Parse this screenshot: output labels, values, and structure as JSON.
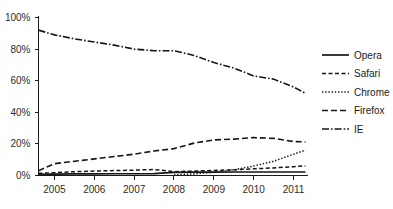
{
  "chart_data": {
    "type": "line",
    "title": "",
    "subtitle": "",
    "xlabel": "",
    "ylabel": "",
    "x": [
      2005,
      2006,
      2007,
      2008,
      2009,
      2010,
      2011
    ],
    "xlim": [
      2004.6,
      2011.3
    ],
    "ylim": [
      0,
      100
    ],
    "xticks": [
      "2005",
      "2006",
      "2007",
      "2008",
      "2009",
      "2010",
      "2011"
    ],
    "yticks": [
      "0%",
      "20%",
      "40%",
      "60%",
      "80%",
      "100%"
    ],
    "ytick_values": [
      0,
      20,
      40,
      60,
      80,
      100
    ],
    "grid": false,
    "legend_position": "right",
    "series": [
      {
        "name": "Opera",
        "style": "solid",
        "dash": "0",
        "width": 1.7,
        "x": [
          2004.6,
          2005,
          2005.5,
          2006,
          2006.5,
          2007,
          2007.5,
          2008,
          2008.5,
          2009,
          2009.5,
          2010,
          2010.5,
          2011,
          2011.3
        ],
        "values": [
          0.8,
          0.9,
          1.0,
          1.0,
          1.1,
          1.1,
          1.2,
          2.0,
          2.1,
          2.1,
          2.2,
          2.2,
          2.2,
          2.2,
          2.2
        ]
      },
      {
        "name": "Safari",
        "style": "dashed",
        "dash": "4,2.5",
        "width": 1.5,
        "x": [
          2004.6,
          2005,
          2005.5,
          2006,
          2006.5,
          2007,
          2007.5,
          2008,
          2008.5,
          2009,
          2009.5,
          2010,
          2010.5,
          2011,
          2011.3
        ],
        "values": [
          1.4,
          1.8,
          2.4,
          2.8,
          3.1,
          3.4,
          3.8,
          2.4,
          2.8,
          3.2,
          3.6,
          4.2,
          4.8,
          5.6,
          6.1
        ]
      },
      {
        "name": "Chrome",
        "style": "dotted",
        "dash": "1.4,1.8",
        "width": 1.5,
        "x": [
          2008.0,
          2008.5,
          2009,
          2009.5,
          2010,
          2010.5,
          2011,
          2011.3
        ],
        "values": [
          0.4,
          1.0,
          2.0,
          3.6,
          6.0,
          9.0,
          13.5,
          16.0
        ]
      },
      {
        "name": "Firefox",
        "style": "dashed-long",
        "dash": "6,3",
        "width": 1.6,
        "x": [
          2004.6,
          2005,
          2005.5,
          2006,
          2006.5,
          2007,
          2007.5,
          2008,
          2008.5,
          2009,
          2009.5,
          2010,
          2010.5,
          2011,
          2011.3
        ],
        "values": [
          3.0,
          7.5,
          9.0,
          10.5,
          12.0,
          13.5,
          15.5,
          17.0,
          20.5,
          22.5,
          23.0,
          24.0,
          23.5,
          21.5,
          21.3
        ]
      },
      {
        "name": "IE",
        "style": "dash-dot",
        "dash": "7,2,1.6,2",
        "width": 1.6,
        "x": [
          2004.6,
          2005,
          2005.5,
          2006,
          2006.5,
          2007,
          2007.5,
          2008,
          2008.5,
          2009,
          2009.5,
          2010,
          2010.5,
          2011,
          2011.3
        ],
        "values": [
          92.0,
          89.0,
          86.5,
          84.5,
          82.5,
          80.0,
          79.0,
          79.0,
          76.0,
          71.5,
          68.0,
          63.0,
          61.0,
          56.0,
          52.0
        ]
      }
    ]
  },
  "legend": {
    "items": [
      {
        "label": "Opera"
      },
      {
        "label": "Safari"
      },
      {
        "label": "Chrome"
      },
      {
        "label": "Firefox"
      },
      {
        "label": "IE"
      }
    ]
  }
}
